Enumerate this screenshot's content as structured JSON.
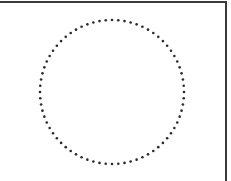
{
  "diagram": {
    "shape": "circle",
    "stroke_style": "dotted",
    "stroke_color": "#2a2a2a",
    "border_color": "#3a3a3a",
    "background": "#ffffff",
    "circle": {
      "cx": 112,
      "cy": 92,
      "r": 72,
      "dot_radius": 1.3,
      "dot_spacing": 6.3
    }
  }
}
